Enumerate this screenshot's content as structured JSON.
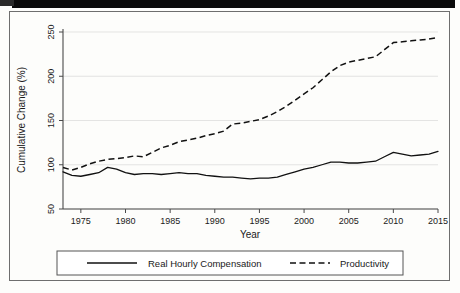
{
  "chart_data": {
    "type": "line",
    "title": "",
    "xlabel": "Year",
    "ylabel": "Cumulative Change (%)",
    "xlim": [
      1973,
      2015
    ],
    "ylim": [
      50,
      250
    ],
    "xticks": [
      1975,
      1980,
      1985,
      1990,
      1995,
      2000,
      2005,
      2010,
      2015
    ],
    "yticks": [
      50,
      100,
      150,
      200,
      250
    ],
    "grid": "horizontal",
    "legend_position": "below-axis",
    "x": [
      1973,
      1974,
      1975,
      1976,
      1977,
      1978,
      1979,
      1980,
      1981,
      1982,
      1983,
      1984,
      1985,
      1986,
      1987,
      1988,
      1989,
      1990,
      1991,
      1992,
      1993,
      1994,
      1995,
      1996,
      1997,
      1998,
      1999,
      2000,
      2001,
      2002,
      2003,
      2004,
      2005,
      2006,
      2007,
      2008,
      2009,
      2010,
      2011,
      2012,
      2013,
      2014,
      2015
    ],
    "series": [
      {
        "name": "Real Hourly Compensation",
        "style": "solid",
        "color": "#111111",
        "values": [
          92,
          88,
          87,
          89,
          91,
          97,
          95,
          91,
          89,
          90,
          90,
          89,
          90,
          91,
          90,
          90,
          88,
          87,
          86,
          86,
          85,
          84,
          85,
          85,
          86,
          89,
          92,
          95,
          97,
          100,
          103,
          103,
          102,
          102,
          103,
          104,
          109,
          114,
          112,
          110,
          111,
          112,
          115
        ]
      },
      {
        "name": "Productivity",
        "style": "dashed",
        "color": "#111111",
        "values": [
          97,
          94,
          97,
          101,
          104,
          106,
          107,
          108,
          110,
          109,
          114,
          119,
          122,
          126,
          128,
          130,
          133,
          135,
          138,
          146,
          147,
          149,
          151,
          155,
          160,
          166,
          173,
          180,
          187,
          196,
          205,
          212,
          216,
          218,
          220,
          222,
          230,
          238,
          239,
          240,
          241,
          242,
          244
        ]
      }
    ]
  },
  "legend": {
    "entries": [
      {
        "label": "Real Hourly Compensation",
        "marker": "solid-line-swatch"
      },
      {
        "label": "Productivity",
        "marker": "dashed-line-swatch"
      }
    ]
  }
}
